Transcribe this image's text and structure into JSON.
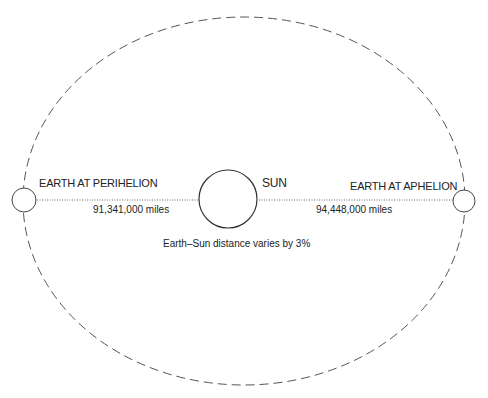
{
  "diagram": {
    "title_fragment": "",
    "orbit": {
      "style": "dashed",
      "color": "#555555"
    },
    "sun": {
      "label": "SUN"
    },
    "perihelion": {
      "label": "EARTH AT PERIHELION",
      "distance": "91,341,000 miles"
    },
    "aphelion": {
      "label": "EARTH AT APHELION",
      "distance": "94,448,000 miles"
    },
    "caption": "Earth–Sun distance varies by 3%"
  }
}
